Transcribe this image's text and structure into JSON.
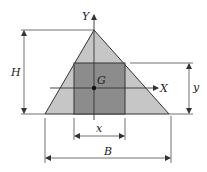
{
  "diagram": {
    "labels": {
      "Y_axis": "Y",
      "X_axis": "X",
      "centroid": "G",
      "height": "H",
      "rect_height": "y",
      "rect_width": "x",
      "base": "B"
    },
    "colors": {
      "triangle_fill": "#c6c6c6",
      "rectangle_fill": "#8c8c8c",
      "line": "#333333"
    }
  }
}
